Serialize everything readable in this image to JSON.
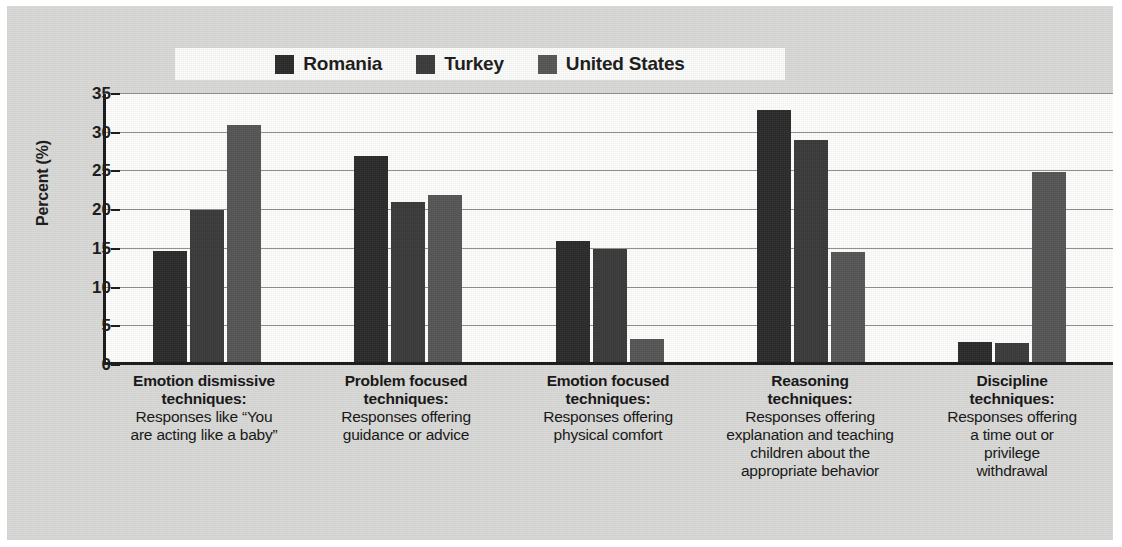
{
  "figure": {
    "background_color": "#d9d9d7",
    "plot_background_color": "#fdfdfc"
  },
  "legend": {
    "position": "top-center",
    "entries": [
      {
        "label": "Romania",
        "color": "#2b2b2b"
      },
      {
        "label": "Turkey",
        "color": "#3a3a3a"
      },
      {
        "label": "United States",
        "color": "#565656"
      }
    ]
  },
  "axis": {
    "ylabel": "Percent (%)",
    "yticks": [
      "0",
      "5",
      "10",
      "15",
      "20",
      "25",
      "30",
      "35"
    ]
  },
  "categories": [
    {
      "title": "Emotion dismissive\ntechniques:",
      "desc": "Responses like “You\nare acting like a baby”"
    },
    {
      "title": "Problem focused\ntechniques:",
      "desc": "Responses offering\nguidance or advice"
    },
    {
      "title": "Emotion focused\ntechniques:",
      "desc": "Responses offering\nphysical comfort"
    },
    {
      "title": "Reasoning\ntechniques:",
      "desc": "Responses offering\nexplanation and teaching\nchildren about the\nappropriate behavior"
    },
    {
      "title": "Discipline\ntechniques:",
      "desc": "Responses offering\na time out or\nprivilege\nwithdrawal"
    }
  ],
  "chart_data": {
    "type": "bar",
    "title": "",
    "xlabel": "",
    "ylabel": "Percent (%)",
    "ylim": [
      0,
      35
    ],
    "ytick_step": 5,
    "grid": true,
    "legend_position": "top-center",
    "categories": [
      "Emotion dismissive techniques: Responses like “You are acting like a baby”",
      "Problem focused techniques: Responses offering guidance or advice",
      "Emotion focused techniques: Responses offering physical comfort",
      "Reasoning techniques: Responses offering explanation and teaching children about the appropriate behavior",
      "Discipline techniques: Responses offering a time out or privilege withdrawal"
    ],
    "series": [
      {
        "name": "Romania",
        "color": "#2b2b2b",
        "values": [
          14.7,
          27.0,
          16.0,
          33.0,
          3.0
        ]
      },
      {
        "name": "Turkey",
        "color": "#3a3a3a",
        "values": [
          20.0,
          21.0,
          15.0,
          29.0,
          2.9
        ]
      },
      {
        "name": "United States",
        "color": "#565656",
        "values": [
          31.0,
          22.0,
          3.4,
          14.6,
          24.9
        ]
      }
    ]
  }
}
